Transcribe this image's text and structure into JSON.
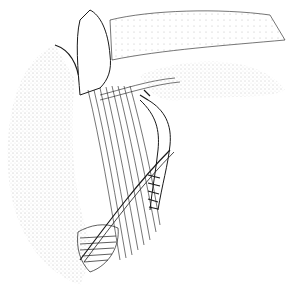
{
  "image": {
    "kind": "anatomical-line-illustration",
    "style": "pen and ink stipple",
    "width": 290,
    "height": 291,
    "colors": {
      "ink": "#1a1a1a",
      "background": "#ffffff",
      "stipple": "#555555"
    }
  }
}
